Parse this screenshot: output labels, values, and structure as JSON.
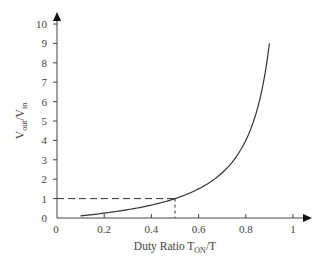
{
  "chart_data": {
    "type": "line",
    "title": "",
    "xlabel": "Duty Ratio T_ON/T",
    "xlabel_parts": {
      "main": "Duty Ratio T",
      "sub": "ON",
      "tail": "/T"
    },
    "ylabel": "V_out/V_in",
    "ylabel_parts": {
      "v1": "V",
      "sub1": "out",
      "slash": "/V",
      "sub2": "in"
    },
    "xlim": [
      0,
      1
    ],
    "ylim": [
      0,
      10
    ],
    "x_ticks": [
      0,
      0.2,
      0.4,
      0.6,
      0.8,
      1
    ],
    "x_tick_labels": [
      "0",
      "0.2",
      "0.4",
      "0.6",
      "0.8",
      "1"
    ],
    "y_ticks": [
      0,
      1,
      2,
      3,
      4,
      5,
      6,
      7,
      8,
      9,
      10
    ],
    "y_tick_labels": [
      "0",
      "1",
      "2",
      "3",
      "4",
      "5",
      "6",
      "7",
      "8",
      "9",
      "10"
    ],
    "grid": false,
    "legend": null,
    "series": [
      {
        "name": "V_out/V_in = D/(1-D)",
        "x": [
          0.1,
          0.2,
          0.3,
          0.4,
          0.5,
          0.6,
          0.65,
          0.7,
          0.75,
          0.8,
          0.85,
          0.9
        ],
        "values": [
          0.11,
          0.25,
          0.43,
          0.67,
          1.0,
          1.5,
          1.86,
          2.33,
          3.0,
          4.0,
          5.67,
          9.0
        ]
      }
    ],
    "annotations": [
      {
        "type": "dashed-hline",
        "y": 1,
        "x_from": 0,
        "x_to": 0.5
      },
      {
        "type": "dashed-vline",
        "x": 0.5,
        "y_from": 0,
        "y_to": 1
      }
    ]
  }
}
